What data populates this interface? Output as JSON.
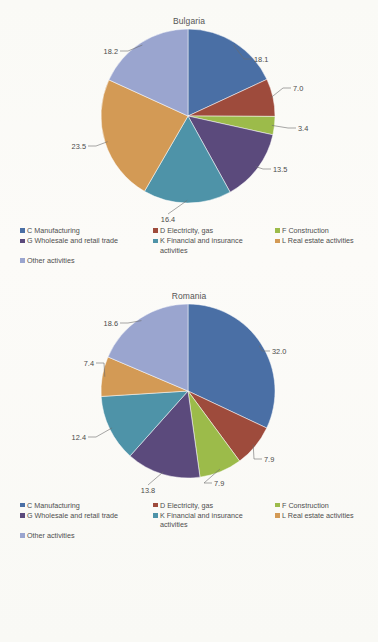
{
  "document": {
    "background_color": "#fbfbf9",
    "text_color": "#4a4a4a"
  },
  "palette": {
    "manufacturing": "#4a6fa5",
    "electricity": "#9e4b3c",
    "construction": "#9cbb4a",
    "wholesale": "#5b4a7c",
    "financial": "#4e93a8",
    "real_estate": "#d39a55",
    "other": "#9aa5cf"
  },
  "legend": {
    "items": [
      {
        "label": "C  Manufacturing",
        "color": "#4a6fa5",
        "key": "manufacturing"
      },
      {
        "label": "D  Electricity, gas",
        "color": "#9e4b3c",
        "key": "electricity"
      },
      {
        "label": "F  Construction",
        "color": "#9cbb4a",
        "key": "construction"
      },
      {
        "label": "G Wholesale and retail trade",
        "color": "#5b4a7c",
        "key": "wholesale"
      },
      {
        "label": "K Financial and insurance\nactivities",
        "color": "#4e93a8",
        "key": "financial"
      },
      {
        "label": "L Real estate activities",
        "color": "#d39a55",
        "key": "real_estate"
      },
      {
        "label": "Other activities",
        "color": "#9aa5cf",
        "key": "other"
      }
    ]
  },
  "chart_data": [
    {
      "type": "pie",
      "title": "Bulgaria",
      "start_angle_deg": 0,
      "direction": "clockwise",
      "labels": [
        "C  Manufacturing",
        "D  Electricity, gas",
        "F  Construction",
        "G Wholesale and retail trade",
        "K Financial and insurance activities",
        "L Real estate activities",
        "Other activities"
      ],
      "values": [
        18.1,
        7.0,
        3.4,
        13.5,
        16.4,
        23.5,
        18.2
      ],
      "value_labels": [
        "18.1",
        "7.0",
        "3.4",
        "13.5",
        "16.4",
        "23.5",
        "18.2"
      ],
      "colors": [
        "#4a6fa5",
        "#9e4b3c",
        "#9cbb4a",
        "#5b4a7c",
        "#4e93a8",
        "#d39a55",
        "#9aa5cf"
      ],
      "total": 100.1,
      "legend_position": "bottom"
    },
    {
      "type": "pie",
      "title": "Romania",
      "start_angle_deg": 0,
      "direction": "clockwise",
      "labels": [
        "C  Manufacturing",
        "D  Electricity, gas",
        "F  Construction",
        "G Wholesale and retail trade",
        "K Financial and insurance activities",
        "L Real estate activities",
        "Other activities"
      ],
      "values": [
        32.0,
        7.9,
        7.9,
        13.8,
        12.4,
        7.4,
        18.6
      ],
      "value_labels": [
        "32.0",
        "7.9",
        "7.9",
        "13.8",
        "12.4",
        "7.4",
        "18.6"
      ],
      "colors": [
        "#4a6fa5",
        "#9e4b3c",
        "#9cbb4a",
        "#5b4a7c",
        "#4e93a8",
        "#d39a55",
        "#9aa5cf"
      ],
      "total": 100.0,
      "legend_position": "bottom"
    }
  ]
}
